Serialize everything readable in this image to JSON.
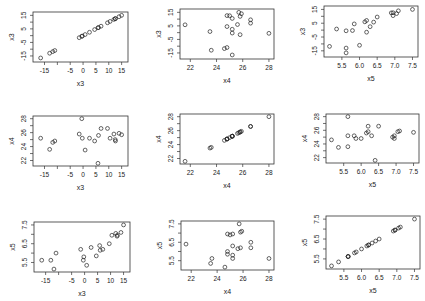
{
  "chart_data": {
    "type": "scatter",
    "title": "",
    "variables": [
      "x3",
      "x4",
      "x5"
    ],
    "axis": {
      "x3": {
        "lim": [
          -18,
          16
        ],
        "ticks": [
          -15,
          -5,
          0,
          5,
          10,
          15
        ],
        "minor_ticks": [
          -15,
          -10,
          -5,
          0,
          5,
          10,
          15
        ],
        "y_ticks": [
          -15,
          -5,
          5,
          15
        ]
      },
      "x4": {
        "lim": [
          21.5,
          28.1
        ],
        "ticks": [
          22,
          24,
          26,
          28
        ],
        "y_ticks": [
          22,
          24,
          26,
          28
        ]
      },
      "x5": {
        "lim": [
          5.1,
          7.55
        ],
        "ticks": [
          5.5,
          6.0,
          6.5,
          7.0,
          7.5
        ],
        "y_ticks": [
          5.5,
          6.5,
          7.5
        ]
      }
    },
    "points": [
      {
        "x3": -16.5,
        "x4": 25.2,
        "x5": 5.62
      },
      {
        "x3": -13.0,
        "x4": 23.6,
        "x5": 5.62
      },
      {
        "x3": -11.8,
        "x4": 24.6,
        "x5": 5.15
      },
      {
        "x3": -11.0,
        "x4": 24.8,
        "x5": 6.0
      },
      {
        "x3": -1.5,
        "x4": 25.8,
        "x5": 6.2
      },
      {
        "x3": -0.5,
        "x4": 28.0,
        "x5": 5.62
      },
      {
        "x3": -0.3,
        "x4": 25.2,
        "x5": 5.8
      },
      {
        "x3": 0.8,
        "x4": 23.5,
        "x5": 5.35
      },
      {
        "x3": 2.5,
        "x4": 25.2,
        "x5": 6.3
      },
      {
        "x3": 4.5,
        "x4": 24.8,
        "x5": 5.85
      },
      {
        "x3": 5.8,
        "x4": 21.6,
        "x5": 6.4
      },
      {
        "x3": 6.0,
        "x4": 25.6,
        "x5": 6.15
      },
      {
        "x3": 7.0,
        "x4": 26.6,
        "x5": 6.2
      },
      {
        "x3": 9.5,
        "x4": 26.6,
        "x5": 6.5
      },
      {
        "x3": 10.5,
        "x4": 25.2,
        "x5": 6.95
      },
      {
        "x3": 12.0,
        "x4": 25.8,
        "x5": 7.05
      },
      {
        "x3": 12.5,
        "x4": 25.0,
        "x5": 6.9
      },
      {
        "x3": 12.6,
        "x4": 24.8,
        "x5": 6.95
      },
      {
        "x3": 14.0,
        "x4": 25.9,
        "x5": 7.1
      },
      {
        "x3": 15.0,
        "x4": 25.7,
        "x5": 7.5
      }
    ],
    "panels": [
      {
        "row": 0,
        "col": 0,
        "x": "x3",
        "y": "x3",
        "xlabel": "x3",
        "ylabel": "x3"
      },
      {
        "row": 0,
        "col": 1,
        "x": "x4",
        "y": "x3",
        "xlabel": "x4",
        "ylabel": "x3"
      },
      {
        "row": 0,
        "col": 2,
        "x": "x5",
        "y": "x3",
        "xlabel": "x5",
        "ylabel": "x3"
      },
      {
        "row": 1,
        "col": 0,
        "x": "x3",
        "y": "x4",
        "xlabel": "x3",
        "ylabel": "x4"
      },
      {
        "row": 1,
        "col": 1,
        "x": "x4",
        "y": "x4",
        "xlabel": "x4",
        "ylabel": "x4"
      },
      {
        "row": 1,
        "col": 2,
        "x": "x5",
        "y": "x4",
        "xlabel": "x5",
        "ylabel": "x4"
      },
      {
        "row": 2,
        "col": 0,
        "x": "x3",
        "y": "x5",
        "xlabel": "x3",
        "ylabel": "x5"
      },
      {
        "row": 2,
        "col": 1,
        "x": "x4",
        "y": "x5",
        "xlabel": "x4",
        "ylabel": "x5"
      },
      {
        "row": 2,
        "col": 2,
        "x": "x5",
        "y": "x5",
        "xlabel": "x5",
        "ylabel": "x5"
      }
    ],
    "grid": false,
    "legend": null,
    "marker": "open-circle"
  },
  "layout": {
    "panel_boxes": [
      [
        33,
        12,
        95,
        50
      ],
      [
        180,
        9,
        94,
        50
      ],
      [
        324,
        6,
        94,
        51
      ],
      [
        33,
        116,
        95,
        50
      ],
      [
        180,
        114,
        94,
        50
      ],
      [
        326,
        114,
        93,
        49
      ],
      [
        34,
        222,
        96,
        50
      ],
      [
        181,
        221,
        93,
        49
      ],
      [
        326,
        216,
        94,
        53
      ]
    ]
  }
}
